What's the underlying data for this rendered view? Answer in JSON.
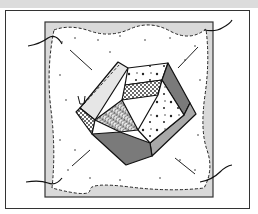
{
  "illustration": {
    "subject": "quilt block with pentagon patchwork and stitching threads",
    "colors": {
      "background": "#ffffff",
      "top_bar": "#dcdcdc",
      "frame_border": "#333333",
      "block_fill": "#d9d9d9",
      "textured_field": "#ffffff",
      "dark_patch": "#7a7a7a",
      "medium_patch": "#a8a8a8",
      "light_patch": "#e6e6e6",
      "outline": "#111111"
    },
    "label": ""
  }
}
